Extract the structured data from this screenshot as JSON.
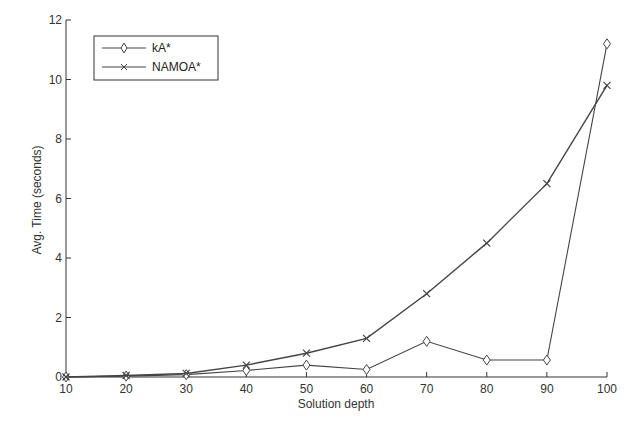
{
  "chart_data": {
    "type": "line",
    "title": "",
    "xlabel": "Solution depth",
    "ylabel": "Avg. Time (seconds)",
    "x": [
      10,
      20,
      30,
      40,
      50,
      60,
      70,
      80,
      90,
      100
    ],
    "x_ticks": [
      "10",
      "20",
      "30",
      "40",
      "50",
      "60",
      "70",
      "80",
      "90",
      "100"
    ],
    "y_ticks": [
      "0",
      "2",
      "4",
      "6",
      "8",
      "10",
      "12"
    ],
    "xlim": [
      10,
      100
    ],
    "ylim": [
      0,
      12
    ],
    "grid": false,
    "legend_position": "upper left",
    "series": [
      {
        "name": "kA*",
        "marker": "diamond",
        "values": [
          0.0,
          0.03,
          0.08,
          0.22,
          0.4,
          0.25,
          1.2,
          0.57,
          0.57,
          11.2
        ]
      },
      {
        "name": "NAMOA*",
        "marker": "x",
        "values": [
          0.0,
          0.05,
          0.12,
          0.4,
          0.8,
          1.3,
          2.8,
          4.5,
          6.5,
          9.8
        ]
      }
    ]
  },
  "colors": {
    "line": "#444444",
    "axis": "#333333"
  }
}
